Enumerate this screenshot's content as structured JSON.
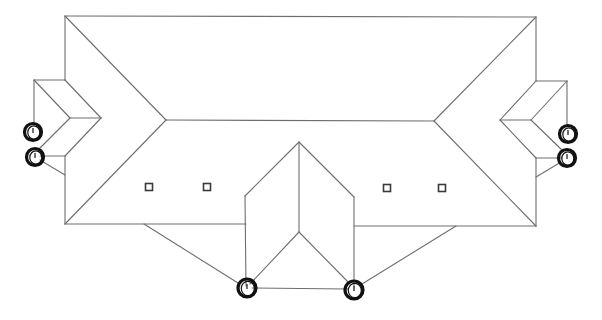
{
  "diagram": {
    "type": "roof-plan",
    "colors": {
      "background": "#ffffff",
      "edge": "#6e6e6e",
      "marker": "#111111",
      "vent": "#3a3a3a"
    },
    "edges": [
      {
        "id": "top-eave",
        "x1": 65,
        "y1": 16,
        "x2": 536,
        "y2": 17
      },
      {
        "id": "left-eave-upper",
        "x1": 65,
        "y1": 16,
        "x2": 65,
        "y2": 80
      },
      {
        "id": "right-eave-upper",
        "x1": 536,
        "y1": 17,
        "x2": 536,
        "y2": 81
      },
      {
        "id": "left-hip-top",
        "x1": 65,
        "y1": 16,
        "x2": 166,
        "y2": 120
      },
      {
        "id": "right-hip-top",
        "x1": 536,
        "y1": 17,
        "x2": 434,
        "y2": 121
      },
      {
        "id": "main-ridge",
        "x1": 166,
        "y1": 120,
        "x2": 434,
        "y2": 121
      },
      {
        "id": "left-hip-bottom",
        "x1": 166,
        "y1": 120,
        "x2": 65,
        "y2": 224
      },
      {
        "id": "right-hip-bottom",
        "x1": 434,
        "y1": 121,
        "x2": 536,
        "y2": 226
      },
      {
        "id": "left-eave-lower",
        "x1": 65,
        "y1": 156,
        "x2": 65,
        "y2": 224
      },
      {
        "id": "right-eave-lower",
        "x1": 536,
        "y1": 158,
        "x2": 536,
        "y2": 226
      },
      {
        "id": "bottom-eave-left",
        "x1": 65,
        "y1": 224,
        "x2": 246,
        "y2": 224
      },
      {
        "id": "bottom-eave-right",
        "x1": 354,
        "y1": 226,
        "x2": 536,
        "y2": 226
      },
      {
        "id": "lw-top",
        "x1": 34,
        "y1": 80,
        "x2": 65,
        "y2": 80
      },
      {
        "id": "lw-outer-side",
        "x1": 34,
        "y1": 80,
        "x2": 34,
        "y2": 124
      },
      {
        "id": "lw-outer-hip",
        "x1": 65,
        "y1": 80,
        "x2": 101,
        "y2": 118
      },
      {
        "id": "lw-inner-hip",
        "x1": 34,
        "y1": 80,
        "x2": 70,
        "y2": 118
      },
      {
        "id": "lw-ridge",
        "x1": 70,
        "y1": 118,
        "x2": 101,
        "y2": 118
      },
      {
        "id": "lw-valley-in",
        "x1": 70,
        "y1": 118,
        "x2": 38,
        "y2": 150
      },
      {
        "id": "lw-valley-out",
        "x1": 101,
        "y1": 118,
        "x2": 65,
        "y2": 156
      },
      {
        "id": "lw-bottom",
        "x1": 40,
        "y1": 156,
        "x2": 65,
        "y2": 156
      },
      {
        "id": "lw-tail",
        "x1": 40,
        "y1": 160,
        "x2": 65,
        "y2": 175
      },
      {
        "id": "rw-top",
        "x1": 536,
        "y1": 81,
        "x2": 567,
        "y2": 81
      },
      {
        "id": "rw-outer-side",
        "x1": 567,
        "y1": 81,
        "x2": 567,
        "y2": 125
      },
      {
        "id": "rw-outer-hip",
        "x1": 536,
        "y1": 81,
        "x2": 500,
        "y2": 120
      },
      {
        "id": "rw-inner-hip",
        "x1": 567,
        "y1": 81,
        "x2": 531,
        "y2": 120
      },
      {
        "id": "rw-ridge",
        "x1": 500,
        "y1": 120,
        "x2": 531,
        "y2": 120
      },
      {
        "id": "rw-valley-in",
        "x1": 531,
        "y1": 120,
        "x2": 563,
        "y2": 151
      },
      {
        "id": "rw-valley-out",
        "x1": 500,
        "y1": 120,
        "x2": 536,
        "y2": 158
      },
      {
        "id": "rw-bottom",
        "x1": 536,
        "y1": 158,
        "x2": 562,
        "y2": 158
      },
      {
        "id": "rw-tail",
        "x1": 536,
        "y1": 177,
        "x2": 561,
        "y2": 162
      },
      {
        "id": "g-left-rake",
        "x1": 245,
        "y1": 196,
        "x2": 299,
        "y2": 142
      },
      {
        "id": "g-right-rake",
        "x1": 299,
        "y1": 142,
        "x2": 354,
        "y2": 197
      },
      {
        "id": "g-ridge",
        "x1": 299,
        "y1": 142,
        "x2": 299,
        "y2": 232
      },
      {
        "id": "g-left-wall",
        "x1": 245,
        "y1": 196,
        "x2": 246,
        "y2": 286
      },
      {
        "id": "g-right-wall",
        "x1": 354,
        "y1": 197,
        "x2": 354,
        "y2": 287
      },
      {
        "id": "g-valley-left",
        "x1": 299,
        "y1": 232,
        "x2": 250,
        "y2": 284
      },
      {
        "id": "g-valley-right",
        "x1": 299,
        "y1": 232,
        "x2": 350,
        "y2": 284
      },
      {
        "id": "g-bottom",
        "x1": 252,
        "y1": 288,
        "x2": 348,
        "y2": 289
      },
      {
        "id": "g-diag-left",
        "x1": 144,
        "y1": 224,
        "x2": 238,
        "y2": 283
      },
      {
        "id": "g-diag-right",
        "x1": 456,
        "y1": 226,
        "x2": 362,
        "y2": 284
      }
    ],
    "vents": [
      {
        "id": "vent-1",
        "x": 149,
        "y": 187,
        "size": 7
      },
      {
        "id": "vent-2",
        "x": 207,
        "y": 187,
        "size": 7
      },
      {
        "id": "vent-3",
        "x": 387,
        "y": 188,
        "size": 7
      },
      {
        "id": "vent-4",
        "x": 442,
        "y": 188,
        "size": 7
      }
    ],
    "markers": [
      {
        "id": "marker-left-upper",
        "cx": 33,
        "cy": 132,
        "r": 8.5
      },
      {
        "id": "marker-left-lower",
        "cx": 35,
        "cy": 157,
        "r": 8.5
      },
      {
        "id": "marker-right-upper",
        "cx": 568,
        "cy": 134,
        "r": 8.5
      },
      {
        "id": "marker-right-lower",
        "cx": 567,
        "cy": 158,
        "r": 8.5
      },
      {
        "id": "marker-bottom-left",
        "cx": 247,
        "cy": 288,
        "r": 9
      },
      {
        "id": "marker-bottom-right",
        "cx": 354,
        "cy": 290,
        "r": 9
      }
    ]
  }
}
